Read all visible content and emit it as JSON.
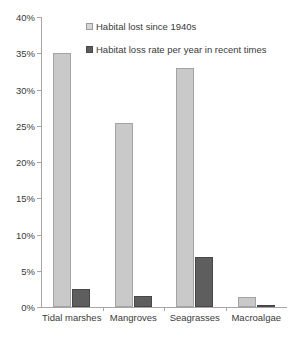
{
  "chart_data": {
    "type": "bar",
    "title": "",
    "subtitle": "",
    "xlabel": "",
    "ylabel": "",
    "grid": false,
    "legend_position": "top-right",
    "categories": [
      "Tidal marshes",
      "Mangroves",
      "Seagrasses",
      "Macroalgae"
    ],
    "series": [
      {
        "name": "Habital lost since 1940s",
        "color": "#c9c9c9",
        "values": [
          35.0,
          25.4,
          33.0,
          1.4
        ]
      },
      {
        "name": "Habitat loss rate per year in recent times",
        "color": "#5e5e5e",
        "values": [
          2.5,
          1.5,
          6.9,
          0.2
        ]
      }
    ],
    "ylim": [
      0,
      40
    ],
    "yticks": [
      0,
      5,
      10,
      15,
      20,
      25,
      30,
      35,
      40
    ],
    "ytick_labels": [
      "0%",
      "5%",
      "10%",
      "15%",
      "20%",
      "25%",
      "30%",
      "35%",
      "40%"
    ]
  },
  "legend": {
    "items": [
      {
        "label": "Habital lost since 1940s",
        "swatch": "light-gray-square-icon"
      },
      {
        "label": "Habitat loss rate per year in recent times",
        "swatch": "dark-gray-square-icon"
      }
    ]
  }
}
